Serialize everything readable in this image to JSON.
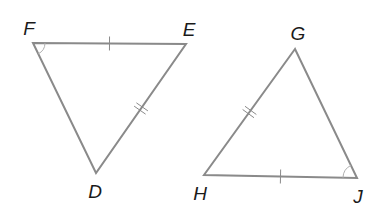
{
  "diagram": {
    "colors": {
      "edge": "#8a8a8a",
      "label": "#1a1a1a",
      "background": "#ffffff"
    },
    "triangles": [
      {
        "name": "DEF",
        "vertices": {
          "F": {
            "x": 33,
            "y": 43,
            "label": "F",
            "label_x": 29,
            "label_y": 28
          },
          "E": {
            "x": 186,
            "y": 44,
            "label": "E",
            "label_x": 189,
            "label_y": 29
          },
          "D": {
            "x": 96,
            "y": 173,
            "label": "D",
            "label_x": 95,
            "label_y": 191
          }
        },
        "markings": {
          "FE": {
            "ticks": 1
          },
          "ED": {
            "ticks": 2
          },
          "angle_F": {
            "arcs": 1
          }
        }
      },
      {
        "name": "GHJ",
        "vertices": {
          "G": {
            "x": 295,
            "y": 49,
            "label": "G",
            "label_x": 298,
            "label_y": 33
          },
          "H": {
            "x": 204,
            "y": 175,
            "label": "H",
            "label_x": 200,
            "label_y": 193
          },
          "J": {
            "x": 357,
            "y": 178,
            "label": "J",
            "label_x": 358,
            "label_y": 196
          }
        },
        "markings": {
          "HJ": {
            "ticks": 1
          },
          "GH": {
            "ticks": 2
          },
          "angle_J": {
            "arcs": 1
          }
        }
      }
    ],
    "labels": [
      "F",
      "E",
      "D",
      "G",
      "H",
      "J"
    ]
  }
}
